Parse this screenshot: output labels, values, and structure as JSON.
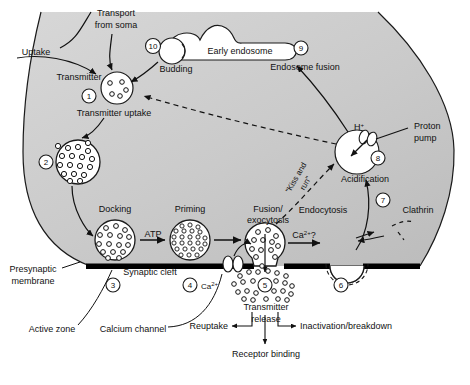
{
  "figure": {
    "title_visible": false,
    "colors": {
      "terminal_fill": "#c9c9c9",
      "terminal_fill_light": "#d9d9d9",
      "membrane": "#000000",
      "stroke": "#1a1a1a",
      "vesicle_fill": "#ffffff",
      "background": "#ffffff"
    }
  },
  "labels": {
    "transport_from_soma": "Transport\nfrom soma",
    "transport_line1": "Transport",
    "transport_line2": "from soma",
    "uptake": "Uptake",
    "transmitter": "Transmitter",
    "transmitter_uptake": "Transmitter uptake",
    "budding": "Budding",
    "early_endosome": "Early endosome",
    "endosome_fusion": "Endosome fusion",
    "proton_pump_line1": "Proton",
    "proton_pump_line2": "pump",
    "h_plus": "H",
    "h_plus_sup": "+",
    "acidification": "Acidification",
    "clathrin": "Clathrin",
    "endocytosis": "Endocytosis",
    "kiss_and_run_line1": "\"Kiss and",
    "kiss_and_run_line2": "run\"",
    "docking": "Docking",
    "atp": "ATP",
    "priming": "Priming",
    "fusion_line1": "Fusion/",
    "fusion_line2": "exocytosis",
    "ca_question": "Ca",
    "ca_question_sup": "2+",
    "ca_question_tail": "?",
    "presynaptic_line1": "Presynaptic",
    "presynaptic_line2": "membrane",
    "synaptic_cleft": "Synaptic cleft",
    "active_zone": "Active zone",
    "calcium_channel": "Calcium channel",
    "calcium_label": "Ca",
    "calcium_label_sup": "2+",
    "transmitter_release_line1": "Transmitter",
    "transmitter_release_line2": "release",
    "reuptake": "Reuptake",
    "inactivation": "Inactivation/breakdown",
    "receptor_binding": "Receptor binding"
  },
  "steps": [
    {
      "n": "1",
      "x": 89,
      "y": 96,
      "name": "step-1-transmitter-uptake"
    },
    {
      "n": "2",
      "x": 46,
      "y": 162,
      "name": "step-2-vesicle-filled"
    },
    {
      "n": "3",
      "x": 113,
      "y": 285,
      "name": "step-3-docking"
    },
    {
      "n": "4",
      "x": 190,
      "y": 285,
      "name": "step-4-calcium-influx"
    },
    {
      "n": "5",
      "x": 265,
      "y": 285,
      "name": "step-5-transmitter-release"
    },
    {
      "n": "6",
      "x": 341,
      "y": 285,
      "name": "step-6-endocytosis"
    },
    {
      "n": "7",
      "x": 383,
      "y": 200,
      "name": "step-7-clathrin-coated-vesicle"
    },
    {
      "n": "8",
      "x": 378,
      "y": 158,
      "name": "step-8-acidification"
    },
    {
      "n": "9",
      "x": 301,
      "y": 48,
      "name": "step-9-endosome-fusion"
    },
    {
      "n": "10",
      "x": 153,
      "y": 46,
      "name": "step-10-budding"
    }
  ],
  "vesicles": [
    {
      "name": "vesicle-transmitter-uptake",
      "cx": 117,
      "cy": 88,
      "r": 16,
      "dots": 5,
      "dot_r": 2.2
    },
    {
      "name": "vesicle-filled-2",
      "cx": 78,
      "cy": 162,
      "r": 22,
      "dots": 22,
      "dot_r": 2.6
    },
    {
      "name": "vesicle-docking",
      "cx": 115,
      "cy": 240,
      "r": 19,
      "dots": 22,
      "dot_r": 2.4
    },
    {
      "name": "vesicle-priming",
      "cx": 190,
      "cy": 240,
      "r": 19,
      "dots": 34,
      "dot_r": 2.2
    },
    {
      "name": "vesicle-fusion",
      "cx": 265,
      "cy": 243,
      "r": 19,
      "dots": 18,
      "dot_r": 2.4
    }
  ]
}
